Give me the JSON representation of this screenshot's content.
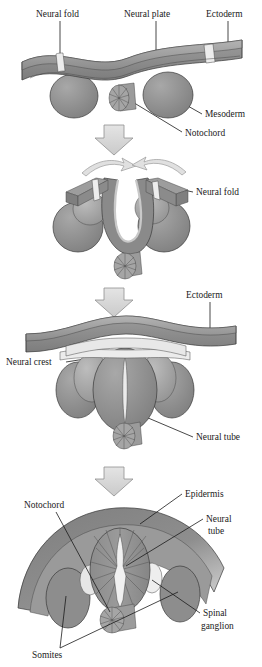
{
  "figure": {
    "panels": [
      {
        "id": "stage-1",
        "labels": [
          {
            "name": "neural-fold",
            "text": "Neural fold"
          },
          {
            "name": "neural-plate",
            "text": "Neural plate"
          },
          {
            "name": "ectoderm",
            "text": "Ectoderm"
          },
          {
            "name": "mesoderm",
            "text": "Mesoderm"
          },
          {
            "name": "notochord",
            "text": "Notochord"
          }
        ]
      },
      {
        "id": "stage-2",
        "labels": [
          {
            "name": "neural-fold",
            "text": "Neural fold"
          }
        ]
      },
      {
        "id": "stage-3",
        "labels": [
          {
            "name": "ectoderm",
            "text": "Ectoderm"
          },
          {
            "name": "neural-crest",
            "text": "Neural crest"
          },
          {
            "name": "neural-tube",
            "text": "Neural tube"
          }
        ]
      },
      {
        "id": "stage-4",
        "labels": [
          {
            "name": "notochord",
            "text": "Notochord"
          },
          {
            "name": "epidermis",
            "text": "Epidermis"
          },
          {
            "name": "neural-tube-line1",
            "text": "Neural"
          },
          {
            "name": "neural-tube-line2",
            "text": "tube"
          },
          {
            "name": "spinal-ganglion-line1",
            "text": "Spinal"
          },
          {
            "name": "spinal-ganglion-line2",
            "text": "ganglion"
          },
          {
            "name": "somites",
            "text": "Somites"
          }
        ]
      }
    ],
    "colors": {
      "background": "#ffffff",
      "ink": "#1b1b1b",
      "sheet_top": "#8a8a8a",
      "sheet_dark": "#6e6e6e",
      "sheet_edge": "#a6a6a6",
      "mesoderm": "#8d8d8d",
      "mesoderm_light": "#a3a3a3",
      "notochord": "#9a9a9a",
      "neural_tube": "#909090",
      "lumen": "#e6e6e6",
      "pale": "#e2e2e2",
      "arrow_fill": "#d9d9d9",
      "arrow_stroke": "#8f8f8f"
    },
    "arrows": [
      {
        "name": "stage-arrow-1-to-2"
      },
      {
        "name": "stage-arrow-2-to-3"
      },
      {
        "name": "stage-arrow-3-to-4"
      }
    ]
  }
}
